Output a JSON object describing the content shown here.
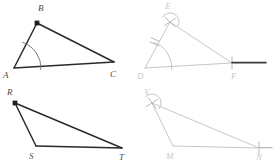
{
  "figure": {
    "background_color": "#ffffff",
    "solid_stroke_color": "#2b2b2b",
    "light_stroke_color": "#c6c6c6",
    "arc_color": "#6e6e6e",
    "label_color": "#4a4a4a",
    "label_light_color": "#c9c9c9"
  },
  "panels": [
    {
      "id": "panel-top-left",
      "name": "original-triangle-abc",
      "kind": "given-figure",
      "shape": "triangle",
      "vertices": [
        {
          "label": "B",
          "x": 37,
          "y": 23,
          "label_x": 38,
          "label_y": 11,
          "marked_dot": true
        },
        {
          "label": "A",
          "x": 14,
          "y": 68,
          "label_x": 3,
          "label_y": 78,
          "marked_dot": false
        },
        {
          "label": "C",
          "x": 114,
          "y": 62,
          "label_x": 110,
          "label_y": 77,
          "marked_dot": false
        }
      ],
      "sides": [
        {
          "from": "A",
          "to": "B"
        },
        {
          "from": "B",
          "to": "C"
        },
        {
          "from": "A",
          "to": "C"
        }
      ],
      "arcs": [
        {
          "name": "angle-arc-at-A",
          "cx": 14,
          "cy": 68,
          "r": 27,
          "start_deg": -72,
          "end_deg": 4
        }
      ]
    },
    {
      "id": "panel-top-right",
      "name": "constructed-triangle-def",
      "kind": "construction-figure",
      "shape": "triangle",
      "vertices": [
        {
          "label": "E",
          "x": 170,
          "y": 22,
          "label_x": 165,
          "label_y": 9,
          "marked_dot": false
        },
        {
          "label": "D",
          "x": 145,
          "y": 68,
          "label_x": 137,
          "label_y": 79,
          "marked_dot": false
        },
        {
          "label": "F",
          "x": 232,
          "y": 63,
          "label_x": 231,
          "label_y": 79,
          "marked_dot": false
        }
      ],
      "sides": [
        {
          "from": "D",
          "to": "E"
        },
        {
          "from": "E",
          "to": "F"
        },
        {
          "from": "D",
          "to": "F"
        }
      ],
      "arcs": [
        {
          "name": "angle-arc-at-D",
          "cx": 145,
          "cy": 68,
          "r": 27,
          "start_deg": -72,
          "end_deg": 4
        },
        {
          "name": "compass-arc-at-E",
          "cx": 170,
          "cy": 22,
          "r": 9,
          "start_deg": 150,
          "end_deg": 330
        }
      ],
      "tick_marks": [
        {
          "name": "tick-on-side-de",
          "x": 156,
          "y": 46,
          "angle_deg": 118,
          "length": 9
        },
        {
          "name": "tick-on-arc-at-D",
          "x": 154,
          "y": 44,
          "angle_deg": 118,
          "length": 9
        },
        {
          "name": "tick-cross-at-E-a",
          "x": 170,
          "y": 22,
          "angle_deg": 35,
          "length": 13
        },
        {
          "name": "tick-cross-at-E-b",
          "x": 170,
          "y": 22,
          "angle_deg": 125,
          "length": 13
        },
        {
          "name": "tick-at-F-vertical",
          "x": 232,
          "y": 63,
          "angle_deg": 90,
          "length": 13
        }
      ],
      "rays": [
        {
          "name": "base-ray-from-F",
          "x1": 232,
          "y1": 63,
          "x2": 266,
          "y2": 63,
          "style": "dark"
        }
      ]
    },
    {
      "id": "panel-bottom-left",
      "name": "original-triangle-rst",
      "kind": "given-figure",
      "shape": "triangle",
      "vertices": [
        {
          "label": "R",
          "x": 15,
          "y": 103,
          "label_x": 7,
          "label_y": 95,
          "marked_dot": true
        },
        {
          "label": "S",
          "x": 36,
          "y": 146,
          "label_x": 29,
          "label_y": 159,
          "marked_dot": false
        },
        {
          "label": "T",
          "x": 122,
          "y": 148,
          "label_x": 119,
          "label_y": 160,
          "marked_dot": false
        }
      ],
      "sides": [
        {
          "from": "R",
          "to": "S"
        },
        {
          "from": "R",
          "to": "T"
        },
        {
          "from": "S",
          "to": "T"
        }
      ],
      "arcs": []
    },
    {
      "id": "panel-bottom-right",
      "name": "constructed-triangle-vmn",
      "kind": "construction-figure",
      "shape": "triangle",
      "vertices": [
        {
          "label": "V",
          "x": 152,
          "y": 103,
          "label_x": 144,
          "label_y": 95,
          "marked_dot": false
        },
        {
          "label": "M",
          "x": 173,
          "y": 146,
          "label_x": 166,
          "label_y": 159,
          "marked_dot": false
        },
        {
          "label": "N",
          "x": 259,
          "y": 148,
          "label_x": 256,
          "label_y": 160,
          "marked_dot": false
        }
      ],
      "sides": [
        {
          "from": "V",
          "to": "M"
        },
        {
          "from": "V",
          "to": "N"
        },
        {
          "from": "M",
          "to": "N"
        }
      ],
      "arcs": [
        {
          "name": "compass-arc-at-V",
          "cx": 152,
          "cy": 103,
          "r": 9,
          "start_deg": 140,
          "end_deg": 320
        }
      ],
      "tick_marks": [
        {
          "name": "tick-cross-at-V-a",
          "x": 152,
          "y": 103,
          "angle_deg": 35,
          "length": 13
        },
        {
          "name": "tick-cross-at-V-b",
          "x": 152,
          "y": 103,
          "angle_deg": 118,
          "length": 13
        },
        {
          "name": "tick-at-N-vertical",
          "x": 259,
          "y": 148,
          "angle_deg": 90,
          "length": 13
        }
      ],
      "rays": [
        {
          "name": "base-ray-from-N",
          "x1": 259,
          "y1": 148,
          "x2": 272,
          "y2": 148,
          "style": "light"
        }
      ]
    }
  ],
  "labels": {
    "B": "B",
    "A": "A",
    "C": "C",
    "E": "E",
    "D": "D",
    "F": "F",
    "R": "R",
    "S": "S",
    "T": "T",
    "V": "V",
    "M": "M",
    "N": "N"
  }
}
